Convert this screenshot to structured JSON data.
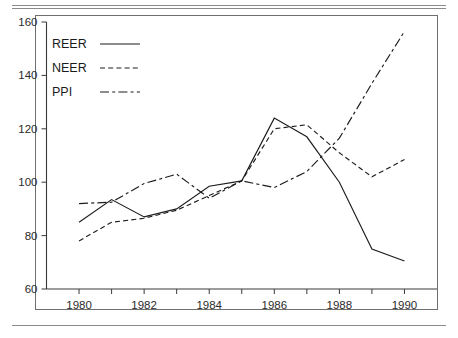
{
  "chart_data": {
    "type": "line",
    "title": "",
    "subtitle": "",
    "xlabel": "",
    "ylabel": "",
    "xlim": [
      1979,
      1991
    ],
    "ylim": [
      60,
      160
    ],
    "grid": false,
    "legend_position": "top-left",
    "x": [
      1980,
      1981,
      1982,
      1983,
      1984,
      1985,
      1986,
      1987,
      1988,
      1989,
      1990
    ],
    "xtick_labels": [
      "1980",
      "1982",
      "1984",
      "1986",
      "1988",
      "1990"
    ],
    "xtick_values": [
      1980,
      1982,
      1984,
      1986,
      1988,
      1990
    ],
    "xtick_minor_values": [
      1981,
      1983,
      1985,
      1987,
      1989
    ],
    "ytick_labels": [
      "60",
      "80",
      "100",
      "120",
      "140",
      "160"
    ],
    "ytick_values": [
      60,
      80,
      100,
      120,
      140,
      160
    ],
    "series": [
      {
        "name": "REER",
        "style": "solid",
        "color": "#1d1d1d",
        "values": [
          85.0,
          93.5,
          87.0,
          90.0,
          98.5,
          100.5,
          124.0,
          117.0,
          100.0,
          75.0,
          70.5
        ]
      },
      {
        "name": "NEER",
        "style": "dashed",
        "color": "#1d1d1d",
        "values": [
          78.0,
          85.0,
          86.5,
          89.5,
          95.0,
          100.5,
          120.0,
          121.5,
          111.0,
          102.0,
          108.5
        ]
      },
      {
        "name": "PPI",
        "style": "dash-dot",
        "color": "#1d1d1d",
        "values": [
          92.0,
          92.5,
          99.5,
          103.0,
          94.0,
          100.5,
          98.0,
          104.0,
          116.5,
          137.0,
          156.5
        ]
      }
    ]
  },
  "legend": {
    "entries": [
      {
        "label": "REER",
        "style": "solid"
      },
      {
        "label": "NEER",
        "style": "dashed"
      },
      {
        "label": "PPI",
        "style": "dash-dot"
      }
    ]
  }
}
